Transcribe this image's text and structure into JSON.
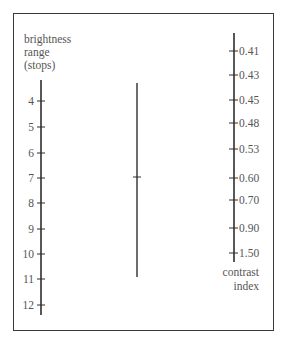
{
  "chart_data": {
    "type": "nomogram",
    "title": "",
    "left_axis": {
      "label": [
        "brightness",
        "range",
        "(stops)"
      ],
      "ticks": [
        {
          "label": "4",
          "y": 101
        },
        {
          "label": "5",
          "y": 127
        },
        {
          "label": "6",
          "y": 153
        },
        {
          "label": "7",
          "y": 178
        },
        {
          "label": "8",
          "y": 203
        },
        {
          "label": "9",
          "y": 229
        },
        {
          "label": "10",
          "y": 254
        },
        {
          "label": "11",
          "y": 279
        },
        {
          "label": "12",
          "y": 305
        }
      ],
      "range": [
        4,
        12
      ]
    },
    "right_axis": {
      "label": [
        "contrast",
        "index"
      ],
      "ticks": [
        {
          "label": "0.41",
          "y": 51
        },
        {
          "label": "0.43",
          "y": 75
        },
        {
          "label": "0.45",
          "y": 100
        },
        {
          "label": "0.48",
          "y": 123
        },
        {
          "label": "0.53",
          "y": 149
        },
        {
          "label": "0.60",
          "y": 178
        },
        {
          "label": "0.70",
          "y": 200
        },
        {
          "label": "0.90",
          "y": 228
        },
        {
          "label": "1.50",
          "y": 253
        }
      ]
    },
    "middle_line": {
      "top_y": 83,
      "bottom_y": 277,
      "marker_y": 177,
      "note": "unlabeled turning/reference line with a single cross mark aligned with 7 stops and 0.60 contrast index"
    }
  },
  "colors": {
    "line": "#2e2e2e",
    "text": "#555555",
    "frame": "#3a3a3a",
    "background": "#ffffff"
  }
}
